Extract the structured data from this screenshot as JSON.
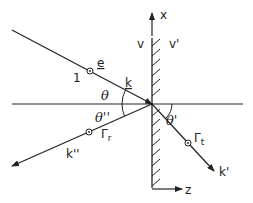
{
  "diagram": {
    "labels": {
      "x_axis": "x",
      "z_axis": "z",
      "medium_left": "v",
      "medium_right": "v'",
      "incident_index": "1",
      "polarization": "e",
      "incident_wave": "k",
      "reflected_wave": "k''",
      "transmitted_wave": "k'",
      "angle_incident": "θ",
      "angle_reflected": "θ''",
      "angle_transmitted": "θ'",
      "gamma_reflected": "Γ",
      "gamma_reflected_sub": "r",
      "gamma_transmitted": "Γ",
      "gamma_transmitted_sub": "t"
    },
    "colors": {
      "line": "#222222",
      "background": "#ffffff"
    }
  }
}
